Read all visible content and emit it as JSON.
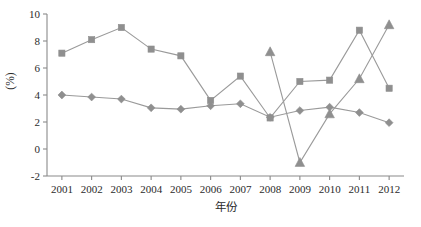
{
  "chart_data": {
    "type": "line",
    "title": "",
    "xlabel": "年份",
    "ylabel": "(%)",
    "categories": [
      "2001",
      "2002",
      "2003",
      "2004",
      "2005",
      "2006",
      "2007",
      "2008",
      "2009",
      "2010",
      "2011",
      "2012"
    ],
    "x": [
      2001,
      2002,
      2003,
      2004,
      2005,
      2006,
      2007,
      2008,
      2009,
      2010,
      2011,
      2012
    ],
    "xlim": [
      2000.5,
      2012.5
    ],
    "ylim": [
      -2,
      10
    ],
    "yticks": [
      -2,
      0,
      2,
      4,
      6,
      8,
      10
    ],
    "ytick_labels": [
      "-2",
      "0",
      "2",
      "4",
      "6",
      "8",
      "10"
    ],
    "grid": false,
    "legend": "none",
    "series": [
      {
        "name": "series-diamond",
        "marker": "diamond",
        "color": "#8f8f8f",
        "values": [
          4.0,
          3.85,
          3.7,
          3.05,
          2.95,
          3.2,
          3.35,
          2.35,
          2.85,
          3.1,
          2.7,
          1.95
        ]
      },
      {
        "name": "series-square",
        "marker": "square",
        "color": "#8f8f8f",
        "values": [
          7.1,
          8.1,
          9.0,
          7.4,
          6.9,
          3.6,
          5.4,
          2.3,
          5.0,
          5.1,
          8.8,
          4.5
        ]
      },
      {
        "name": "series-triangle",
        "marker": "triangle",
        "color": "#8f8f8f",
        "values": [
          null,
          null,
          null,
          null,
          null,
          null,
          null,
          7.2,
          -1.0,
          2.6,
          5.2,
          9.2
        ]
      }
    ]
  },
  "axes": {
    "y_axis_title": "(%)",
    "x_axis_title": "年份",
    "y_tick_labels": [
      "10",
      "8",
      "6",
      "4",
      "2",
      "0",
      "-2"
    ],
    "x_tick_labels": [
      "2001",
      "2002",
      "2003",
      "2004",
      "2005",
      "2006",
      "2007",
      "2008",
      "2009",
      "2010",
      "2011",
      "2012"
    ]
  },
  "colors": {
    "axis": "#8a8a8a",
    "line": "#9a9a9a",
    "marker": "#8f8f8f",
    "text": "#2b2b2b",
    "background": "#ffffff"
  }
}
